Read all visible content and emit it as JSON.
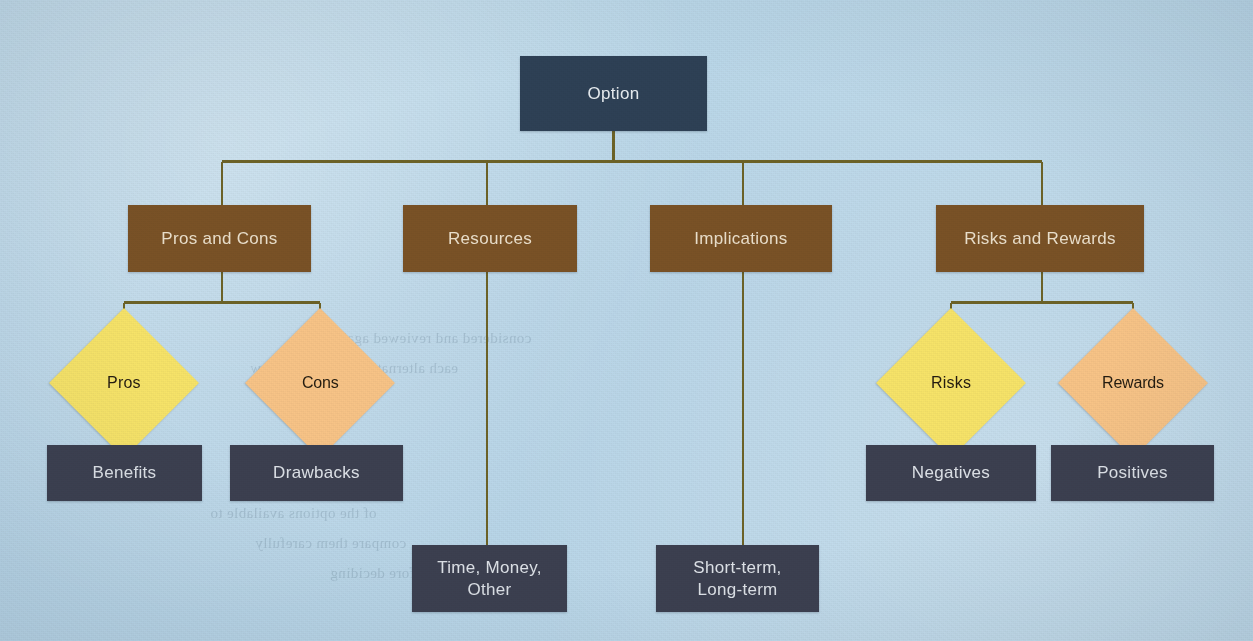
{
  "diagram": {
    "background_color": "#b9d7e9",
    "connector_color": "#6d6327",
    "root": {
      "label": "Option",
      "color": "#2e4156"
    },
    "branches": [
      {
        "label": "Pros and Cons",
        "color": "#7a5226",
        "children": [
          {
            "label": "Pros",
            "shape": "diamond",
            "color": "#f7e469",
            "children": [
              {
                "label": "Benefits",
                "shape": "rect",
                "color": "#3c4050"
              }
            ]
          },
          {
            "label": "Cons",
            "shape": "diamond",
            "color": "#f8c487",
            "children": [
              {
                "label": "Drawbacks",
                "shape": "rect",
                "color": "#3c4050"
              }
            ]
          }
        ]
      },
      {
        "label": "Resources",
        "color": "#7a5226",
        "children": [
          {
            "label": "Time, Money, Other",
            "line1": "Time, Money,",
            "line2": "Other",
            "shape": "rect",
            "color": "#3c4050"
          }
        ]
      },
      {
        "label": "Implications",
        "color": "#7a5226",
        "children": [
          {
            "label": "Short-term, Long-term",
            "line1": "Short-term,",
            "line2": "Long-term",
            "shape": "rect",
            "color": "#3c4050"
          }
        ]
      },
      {
        "label": "Risks and Rewards",
        "color": "#7a5226",
        "children": [
          {
            "label": "Risks",
            "shape": "diamond",
            "color": "#f7e469",
            "children": [
              {
                "label": "Negatives",
                "shape": "rect",
                "color": "#3c4050"
              }
            ]
          },
          {
            "label": "Rewards",
            "shape": "diamond",
            "color": "#f8c487",
            "children": [
              {
                "label": "Positives",
                "shape": "rect",
                "color": "#3c4050"
              }
            ]
          }
        ]
      }
    ],
    "showthrough_text": [
      "considered and reviewed against the",
      "each alternative in the list below",
      "of the options available to",
      "compare them carefully",
      "before deciding"
    ]
  }
}
